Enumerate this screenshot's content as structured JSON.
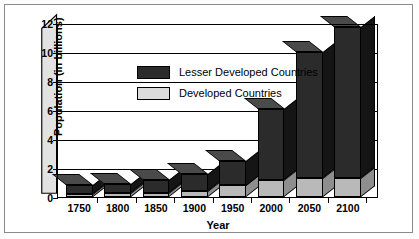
{
  "chart_data": {
    "type": "bar",
    "subtype": "stacked-3d-column",
    "title": "",
    "xlabel": "Year",
    "ylabel": "Population (in billions)",
    "categories": [
      "1750",
      "1800",
      "1850",
      "1900",
      "1950",
      "2000",
      "2050",
      "2100"
    ],
    "series": [
      {
        "name": "Developed Countries",
        "color": "#b9b9b9",
        "values": [
          0.2,
          0.25,
          0.3,
          0.4,
          0.8,
          1.2,
          1.3,
          1.3
        ]
      },
      {
        "name": "Lesser Developed Countries",
        "color": "#2b2b2b",
        "values": [
          0.6,
          0.65,
          0.9,
          1.2,
          1.7,
          4.9,
          8.7,
          10.4
        ]
      }
    ],
    "totals": [
      0.8,
      0.9,
      1.2,
      1.6,
      2.5,
      6.1,
      10.0,
      11.7
    ],
    "ylim": [
      0,
      12
    ],
    "yticks": [
      "0",
      "2",
      "4",
      "6",
      "8",
      "10",
      "12"
    ],
    "ytick_values": [
      0,
      2,
      4,
      6,
      8,
      10,
      12
    ],
    "grid": true,
    "legend_position": "inside-top-left"
  },
  "legend": {
    "items": [
      {
        "label": "Lesser Developed Countries",
        "swatch": "dark"
      },
      {
        "label": "Developed Countries",
        "swatch": "light"
      }
    ]
  },
  "axes": {
    "y_title": "Population (in billions)",
    "x_title": "Year"
  }
}
